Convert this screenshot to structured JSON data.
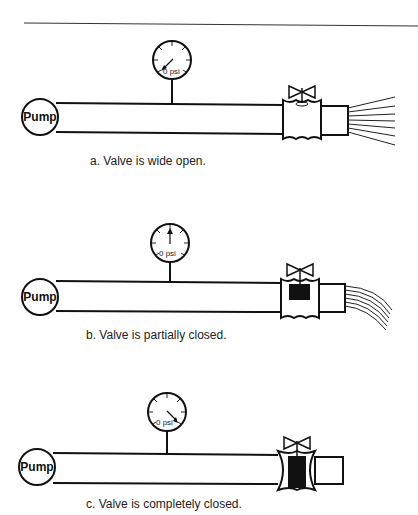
{
  "figure": {
    "top_rule": true,
    "panels": [
      {
        "id": "a",
        "caption": "a. Valve is wide open.",
        "pump_label": "Pump",
        "gauge_reading": "0 psi",
        "needle_direction": "down-left",
        "valve_state": "open",
        "outflow": "straight spray"
      },
      {
        "id": "b",
        "caption": "b. Valve is partially closed.",
        "pump_label": "Pump",
        "gauge_reading": "0 psi",
        "needle_direction": "up",
        "valve_state": "partially closed",
        "outflow": "curved drooping stream"
      },
      {
        "id": "c",
        "caption": "c. Valve is completely closed.",
        "pump_label": "Pump",
        "gauge_reading": "0 psi",
        "needle_direction": "down-right",
        "valve_state": "closed",
        "outflow": "none"
      }
    ]
  }
}
